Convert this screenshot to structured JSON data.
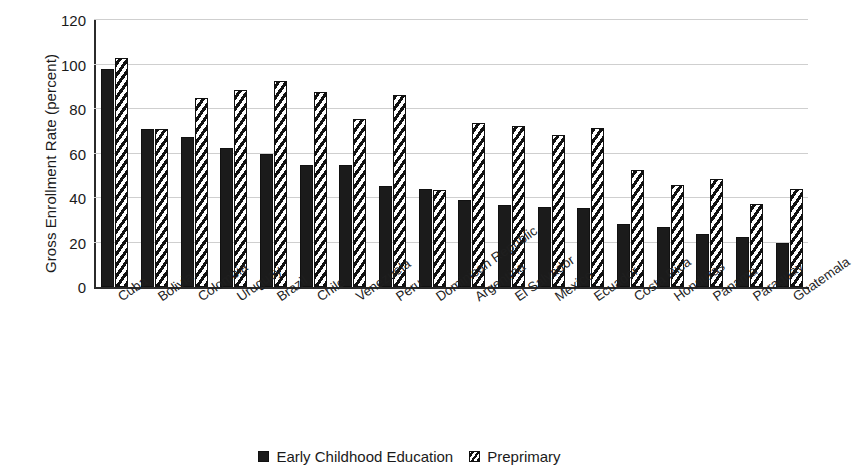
{
  "chart_data": {
    "type": "bar",
    "title": "",
    "xlabel": "",
    "ylabel": "Gross Enrollment Rate (percent)",
    "ylim": [
      0,
      120
    ],
    "yticks": [
      0,
      20,
      40,
      60,
      80,
      100,
      120
    ],
    "grid": true,
    "legend_position": "bottom",
    "categories": [
      "Cuba",
      "Bolivia",
      "Colombia",
      "Uruguay",
      "Brazil",
      "Chile",
      "Venezuela",
      "Peru",
      "Dominican Republic",
      "Argentina",
      "El Salvador",
      "Mexico",
      "Ecuador",
      "Costa Rica",
      "Honduras",
      "Panama",
      "Paraguay",
      "Guatemala"
    ],
    "series": [
      {
        "name": "Early Childhood Education",
        "pattern": "solid",
        "color": "#1b1b1b",
        "values": [
          98,
          71,
          67.5,
          62.5,
          60,
          55,
          55,
          45.5,
          44,
          39,
          37,
          36,
          35.5,
          28.5,
          27,
          24,
          22.5,
          20
        ]
      },
      {
        "name": "Preprimary",
        "pattern": "diagonal-hatch",
        "color": "#ffffff",
        "values": [
          103,
          71,
          85,
          88.5,
          92.5,
          87.5,
          75.5,
          86.5,
          43.5,
          73.5,
          72.5,
          68.5,
          71.5,
          52.5,
          46,
          48.5,
          37.5,
          44
        ]
      }
    ]
  },
  "legend": {
    "items": [
      {
        "label": "Early Childhood Education",
        "swatch": "solid-square-icon"
      },
      {
        "label": "Preprimary",
        "swatch": "hatched-square-icon"
      }
    ]
  }
}
